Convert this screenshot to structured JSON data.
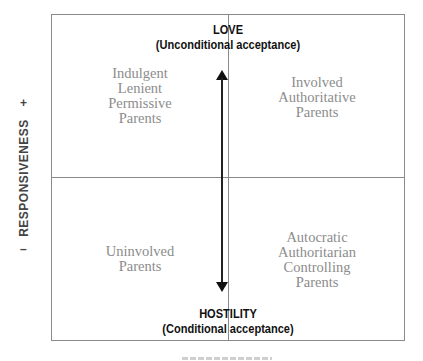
{
  "diagram": {
    "top_heading": {
      "title": "LOVE",
      "subtitle": "(Unconditional acceptance)"
    },
    "bottom_heading": {
      "title": "HOSTILITY",
      "subtitle": "(Conditional acceptance)"
    },
    "y_axis": {
      "label": "RESPONSIVENESS",
      "plus": "+",
      "minus": "–"
    },
    "quadrants": {
      "top_left": {
        "lines": [
          "Indulgent",
          "Lenient",
          "Permissive",
          "Parents"
        ]
      },
      "top_right": {
        "lines": [
          "Involved",
          "Authoritative",
          "Parents"
        ]
      },
      "bottom_left": {
        "lines": [
          "Uninvolved",
          "Parents"
        ]
      },
      "bottom_right": {
        "lines": [
          "Autocratic",
          "Authoritarian",
          "Controlling",
          "Parents"
        ]
      }
    },
    "arrow": {
      "type": "double-headed-vertical"
    },
    "colors": {
      "border": "#8a8a8a",
      "heading": "#111111",
      "quadrant_text": "#8c8c8c",
      "axis_text": "#444444"
    }
  }
}
